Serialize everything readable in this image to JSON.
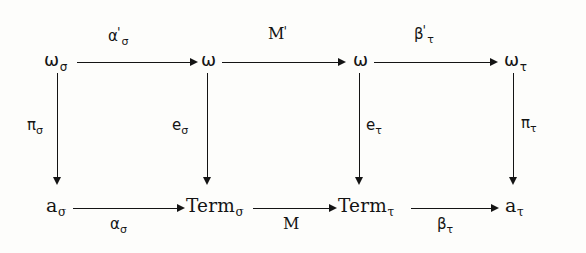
{
  "figure": {
    "kind": "commutative-diagram",
    "background_color": "#fdfdfb",
    "ink_color": "#141414"
  },
  "nodes": {
    "top_left": {
      "base": "ω",
      "sub": "σ"
    },
    "top_mid_left": {
      "base": "ω",
      "sub": ""
    },
    "top_mid_right": {
      "base": "ω",
      "sub": ""
    },
    "top_right": {
      "base": "ω",
      "sub": "τ"
    },
    "bottom_left": {
      "base": "a",
      "sub": "σ"
    },
    "bottom_mid_left": {
      "base": "Term",
      "sub": "σ"
    },
    "bottom_mid_right": {
      "base": "Term",
      "sub": "τ"
    },
    "bottom_right": {
      "base": "a",
      "sub": "τ"
    }
  },
  "arrow_labels": {
    "top_left_arrow": {
      "base": "α",
      "prime": "'",
      "sub": "σ"
    },
    "top_mid_arrow": {
      "base": "M",
      "prime": "'",
      "sub": ""
    },
    "top_right_arrow": {
      "base": "β",
      "prime": "'",
      "sub": "τ"
    },
    "bottom_left_arrow": {
      "base": "α",
      "prime": "",
      "sub": "σ"
    },
    "bottom_mid_arrow": {
      "base": "M",
      "prime": "",
      "sub": ""
    },
    "bottom_right_arrow": {
      "base": "β",
      "prime": "",
      "sub": "τ"
    },
    "left_vertical": {
      "base": "π",
      "prime": "",
      "sub": "σ"
    },
    "mid_left_vertical": {
      "base": "e",
      "prime": "",
      "sub": "σ"
    },
    "mid_right_vertical": {
      "base": "e",
      "prime": "",
      "sub": "τ"
    },
    "right_vertical": {
      "base": "π",
      "prime": "",
      "sub": "τ"
    }
  }
}
